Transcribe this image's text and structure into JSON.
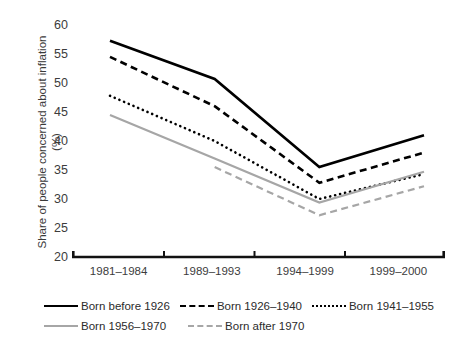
{
  "figure": {
    "clipped_top_text": "",
    "background": "#ffffff"
  },
  "axes": {
    "ylabel_line1": "Share of people concerned about inflation",
    "ylabel_line2": "(%)",
    "ytick_labels": [
      "60",
      "55",
      "50",
      "45",
      "40",
      "35",
      "30",
      "25",
      "20"
    ],
    "xtick_labels": [
      "1981–1984",
      "1989–1993",
      "1994–1999",
      "1999–2000"
    ]
  },
  "legend": {
    "row1": [
      {
        "label": "Born before 1926",
        "key": "solid-black-line-key"
      },
      {
        "label": "Born 1926–1940",
        "key": "dashed-black-line-key"
      },
      {
        "label": "Born 1941–1955",
        "key": "dotted-black-line-key"
      }
    ],
    "row2": [
      {
        "label": "Born 1956–1970",
        "key": "solid-gray-line-key"
      },
      {
        "label": "Born after 1970",
        "key": "dashed-gray-line-key"
      }
    ]
  },
  "chart_data": {
    "type": "line",
    "title": "",
    "xlabel": "",
    "ylabel": "Share of people concerned about inflation (%)",
    "categories": [
      "1981–1984",
      "1989–1993",
      "1994–1999",
      "1999–2000"
    ],
    "ylim": [
      20,
      60
    ],
    "ytick_step": 5,
    "grid": false,
    "legend_position": "bottom",
    "series": [
      {
        "name": "Born before 1926",
        "values": [
          57.3,
          50.7,
          35.5,
          41.0
        ],
        "color": "#000000",
        "style": "solid",
        "width": 2.6
      },
      {
        "name": "Born 1926–1940",
        "values": [
          54.5,
          46.0,
          32.8,
          38.0
        ],
        "color": "#000000",
        "style": "dashed",
        "width": 2.6
      },
      {
        "name": "Born 1941–1955",
        "values": [
          47.8,
          40.0,
          30.0,
          34.3
        ],
        "color": "#000000",
        "style": "dotted",
        "width": 2.6
      },
      {
        "name": "Born 1956–1970",
        "values": [
          44.5,
          37.0,
          29.4,
          34.7
        ],
        "color": "#a6a6a6",
        "style": "solid",
        "width": 2.2
      },
      {
        "name": "Born after 1970",
        "values": [
          null,
          35.5,
          27.2,
          32.2
        ],
        "color": "#a6a6a6",
        "style": "dashed",
        "width": 2.2
      }
    ]
  }
}
